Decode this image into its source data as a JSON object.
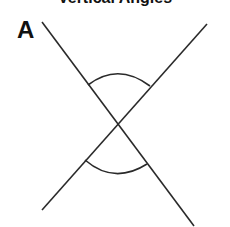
{
  "title_fragment": "Vertical Angles",
  "panel_label": "A",
  "colors": {
    "background": "#ffffff",
    "stroke": "#2a2a2a",
    "label": "#111111"
  },
  "geometry": {
    "intersection": [
      117,
      124
    ],
    "line_1": {
      "from": [
        42,
        22
      ],
      "to": [
        194,
        226
      ]
    },
    "line_2": {
      "from": [
        207,
        24
      ],
      "to": [
        42,
        210
      ]
    },
    "arc_top": {
      "from": [
        88,
        85
      ],
      "to": [
        150,
        86
      ],
      "peak_y": 74
    },
    "arc_bottom": {
      "from": [
        85,
        160
      ],
      "to": [
        147,
        164
      ],
      "low_y": 172
    }
  }
}
